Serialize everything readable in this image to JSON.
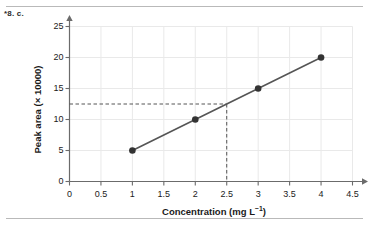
{
  "question_label": "*8. c.",
  "chart_data": {
    "type": "line",
    "title": "",
    "subtitle": "",
    "xlabel": "Concentration (mg L−1)",
    "xlabel_base": "Concentration (mg L",
    "xlabel_sup": "−1",
    "xlabel_tail": ")",
    "ylabel": "Peak area (× 10000)",
    "x": [
      1,
      2,
      3,
      4
    ],
    "values": [
      5,
      10,
      15,
      20
    ],
    "series": [
      {
        "name": "Calibration curve",
        "x": [
          1,
          2,
          3,
          4
        ],
        "values": [
          5,
          10,
          15,
          20
        ]
      }
    ],
    "xlim": [
      0,
      4.5
    ],
    "ylim": [
      0,
      25
    ],
    "xticks": [
      0,
      0.5,
      1,
      1.5,
      2,
      2.5,
      3,
      3.5,
      4,
      4.5
    ],
    "xticklabels": [
      "0",
      "0.5",
      "1",
      "1.5",
      "2",
      "2.5",
      "3",
      "3.5",
      "4",
      "4.5"
    ],
    "yticks": [
      0,
      5,
      10,
      15,
      20,
      25
    ],
    "yticklabels": [
      "0",
      "5",
      "10",
      "15",
      "20",
      "25"
    ],
    "grid": true,
    "legend": "none",
    "marker": "filled-circle",
    "annotations": [
      {
        "name": "interpolation-guide",
        "style": "dashed",
        "x": 2.5,
        "y": 12.5,
        "description": "Dashed lines from y-axis at 12.5 to the line, then down to x-axis at 2.5"
      }
    ],
    "colors": {
      "line": "#555555",
      "marker": "#333333",
      "grid": "#e9e9e9",
      "axis": "#6b6b6b",
      "dashed": "#555555",
      "text": "#1a1a1a",
      "background": "#ffffff",
      "rule": "#b9b9b9"
    }
  }
}
